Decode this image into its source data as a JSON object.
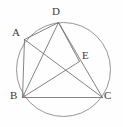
{
  "figure": {
    "stroke_color": "#6e6e6e",
    "circle_color": "#8a8a8a",
    "label_color": "#3a3a3a",
    "background_color": "#fefefe"
  },
  "circle": {
    "name": "circumscribed-circle",
    "cx": 63.5,
    "cy": 69.5,
    "r": 47
  },
  "points": [
    {
      "id": "A",
      "label": "A",
      "x": 24.5,
      "y": 39.5,
      "label_x": 12,
      "label_y": 27
    },
    {
      "id": "D",
      "label": "D",
      "x": 58.5,
      "y": 22.5,
      "label_x": 52,
      "label_y": 6
    },
    {
      "id": "E",
      "label": "E",
      "x": 79.5,
      "y": 61.5,
      "label_x": 82,
      "label_y": 50
    },
    {
      "id": "B",
      "label": "B",
      "x": 22.5,
      "y": 97.5,
      "label_x": 10,
      "label_y": 90
    },
    {
      "id": "C",
      "label": "C",
      "x": 102.5,
      "y": 97.5,
      "label_x": 104,
      "label_y": 90
    }
  ],
  "segments": [
    {
      "name": "segment-AB",
      "from": "A",
      "to": "B"
    },
    {
      "name": "segment-AD",
      "from": "A",
      "to": "D"
    },
    {
      "name": "segment-AC",
      "from": "A",
      "to": "C"
    },
    {
      "name": "segment-BD",
      "from": "B",
      "to": "D"
    },
    {
      "name": "segment-BE",
      "from": "B",
      "to": "E"
    },
    {
      "name": "segment-BC",
      "from": "B",
      "to": "C"
    },
    {
      "name": "segment-DC",
      "from": "D",
      "to": "C"
    },
    {
      "name": "segment-DE",
      "from": "D",
      "to": "E"
    }
  ]
}
